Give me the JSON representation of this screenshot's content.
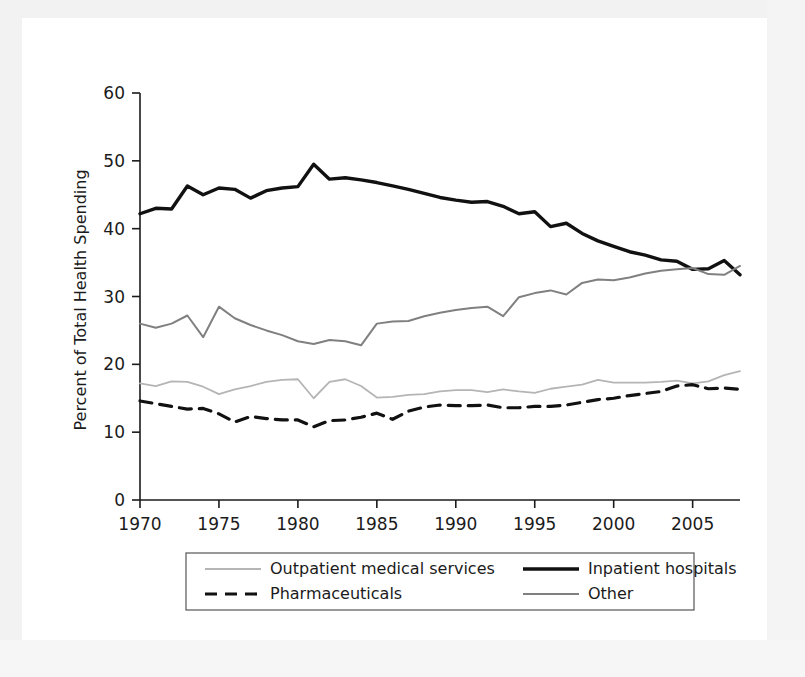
{
  "chart_data": {
    "type": "line",
    "title": "",
    "xlabel": "",
    "ylabel": "Percent of Total Health Spending",
    "xlim": [
      1970,
      2008
    ],
    "ylim": [
      0,
      60
    ],
    "yticks": [
      0,
      10,
      20,
      30,
      40,
      50,
      60
    ],
    "xticks": [
      1970,
      1975,
      1980,
      1985,
      1990,
      1995,
      2000,
      2005
    ],
    "grid": false,
    "legend_position": "below-plot",
    "x": [
      1970,
      1971,
      1972,
      1973,
      1974,
      1975,
      1976,
      1977,
      1978,
      1979,
      1980,
      1981,
      1982,
      1983,
      1984,
      1985,
      1986,
      1987,
      1988,
      1989,
      1990,
      1991,
      1992,
      1993,
      1994,
      1995,
      1996,
      1997,
      1998,
      1999,
      2000,
      2001,
      2002,
      2003,
      2004,
      2005,
      2006,
      2007,
      2008
    ],
    "series": [
      {
        "name": "Inpatient hospitals",
        "color": "#111111",
        "style": "solid-thick",
        "values": [
          42.2,
          43.0,
          42.9,
          46.3,
          45.0,
          46.0,
          45.8,
          44.5,
          45.6,
          46.0,
          46.2,
          49.5,
          47.3,
          47.5,
          47.2,
          46.8,
          46.3,
          45.8,
          45.2,
          44.6,
          44.2,
          43.9,
          44.0,
          43.3,
          42.2,
          42.5,
          40.3,
          40.8,
          39.3,
          38.2,
          37.4,
          36.6,
          36.1,
          35.4,
          35.2,
          34.0,
          34.1,
          35.3,
          33.2
        ]
      },
      {
        "name": "Other",
        "color": "#808080",
        "style": "solid-medium",
        "values": [
          26.0,
          25.4,
          26.0,
          27.2,
          24.0,
          28.5,
          26.8,
          25.8,
          25.0,
          24.3,
          23.4,
          23.0,
          23.6,
          23.4,
          22.8,
          26.0,
          26.3,
          26.4,
          27.1,
          27.6,
          28.0,
          28.3,
          28.5,
          27.1,
          29.9,
          30.5,
          30.9,
          30.3,
          32.0,
          32.5,
          32.4,
          32.8,
          33.4,
          33.8,
          34.0,
          34.2,
          33.3,
          33.2,
          34.5
        ]
      },
      {
        "name": "Outpatient medical services",
        "color": "#b5b5b5",
        "style": "solid-light",
        "values": [
          17.2,
          16.8,
          17.5,
          17.4,
          16.7,
          15.6,
          16.3,
          16.8,
          17.4,
          17.7,
          17.8,
          15.0,
          17.4,
          17.8,
          16.8,
          15.1,
          15.2,
          15.5,
          15.6,
          16.0,
          16.2,
          16.2,
          15.9,
          16.3,
          16.0,
          15.8,
          16.4,
          16.7,
          17.0,
          17.7,
          17.3,
          17.3,
          17.3,
          17.4,
          17.6,
          17.2,
          17.5,
          18.4,
          19.0
        ]
      },
      {
        "name": "Pharmaceuticals",
        "color": "#111111",
        "style": "dashed",
        "values": [
          14.6,
          14.2,
          13.8,
          13.4,
          13.5,
          12.7,
          11.5,
          12.3,
          12.0,
          11.8,
          11.8,
          10.8,
          11.7,
          11.8,
          12.2,
          12.8,
          11.9,
          13.1,
          13.7,
          14.0,
          13.9,
          13.9,
          14.0,
          13.6,
          13.6,
          13.8,
          13.8,
          14.0,
          14.4,
          14.8,
          15.0,
          15.4,
          15.7,
          16.0,
          16.8,
          17.0,
          16.4,
          16.5,
          16.3
        ]
      }
    ]
  },
  "axes": {
    "ylabel": "Percent of Total Health Spending",
    "ytick_labels": [
      "60",
      "50",
      "40",
      "30",
      "20",
      "10",
      "0"
    ],
    "xtick_labels": [
      "1970",
      "1975",
      "1980",
      "1985",
      "1990",
      "1995",
      "2000",
      "2005"
    ]
  },
  "legend": {
    "entries": [
      {
        "label": "Outpatient medical services",
        "swatch": "solid-light"
      },
      {
        "label": "Inpatient hospitals",
        "swatch": "solid-thick"
      },
      {
        "label": "Pharmaceuticals",
        "swatch": "dashed"
      },
      {
        "label": "Other",
        "swatch": "solid-medium"
      }
    ]
  }
}
